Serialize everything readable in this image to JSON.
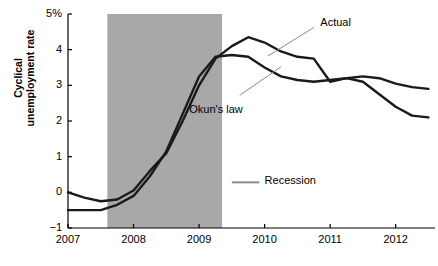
{
  "chart_data": {
    "type": "line",
    "title": "",
    "xlabel": "",
    "ylabel": "Cyclical unemployment rate",
    "ylabel_line1": "Cyclical",
    "ylabel_line2": "unemployment rate",
    "xlim": [
      2007.0,
      2012.6
    ],
    "ylim": [
      -1,
      5
    ],
    "yticks": [
      -1,
      0,
      1,
      2,
      3,
      4,
      5
    ],
    "ytick_labels": [
      "−1",
      "0",
      "1",
      "2",
      "3",
      "4",
      "5%"
    ],
    "xticks": [
      2007,
      2008,
      2009,
      2010,
      2011,
      2012
    ],
    "xtick_labels": [
      "2007",
      "2008",
      "2009",
      "2010",
      "2011",
      "2012"
    ],
    "grid": false,
    "legend_position": "inline-annotations",
    "series": [
      {
        "name": "Actual",
        "color": "#1a1a1a",
        "x": [
          2007.0,
          2007.25,
          2007.5,
          2007.75,
          2008.0,
          2008.25,
          2008.5,
          2008.75,
          2009.0,
          2009.25,
          2009.5,
          2009.75,
          2010.0,
          2010.25,
          2010.5,
          2010.75,
          2011.0,
          2011.25,
          2011.5,
          2011.75,
          2012.0,
          2012.25,
          2012.5
        ],
        "y": [
          0.0,
          -0.15,
          -0.25,
          -0.2,
          0.05,
          0.6,
          1.1,
          2.0,
          3.0,
          3.75,
          4.1,
          4.35,
          4.2,
          3.95,
          3.8,
          3.75,
          3.1,
          3.2,
          3.25,
          3.2,
          3.05,
          2.95,
          2.9
        ]
      },
      {
        "name": "Okun's law",
        "color": "#1a1a1a",
        "x": [
          2007.0,
          2007.25,
          2007.5,
          2007.75,
          2008.0,
          2008.25,
          2008.5,
          2008.75,
          2009.0,
          2009.25,
          2009.5,
          2009.75,
          2010.0,
          2010.25,
          2010.5,
          2010.75,
          2011.0,
          2011.25,
          2011.5,
          2011.75,
          2012.0,
          2012.25,
          2012.5
        ],
        "y": [
          -0.5,
          -0.5,
          -0.5,
          -0.35,
          -0.1,
          0.45,
          1.15,
          2.2,
          3.25,
          3.8,
          3.85,
          3.8,
          3.5,
          3.25,
          3.15,
          3.1,
          3.15,
          3.2,
          3.1,
          2.75,
          2.4,
          2.15,
          2.1
        ]
      }
    ],
    "shaded_regions": [
      {
        "label": "Recession",
        "x_start": 2007.6,
        "x_end": 2009.35,
        "color": "#a8a8a8"
      }
    ],
    "annotations": [
      {
        "name": "actual",
        "text": "Actual",
        "x": 2011.0,
        "y": 4.8
      },
      {
        "name": "okuns-law",
        "text": "Okun's law",
        "y": 2.55,
        "x": 2009.5
      },
      {
        "name": "recession",
        "text": "Recession",
        "x": 2010.1,
        "y": 0.22
      }
    ]
  }
}
